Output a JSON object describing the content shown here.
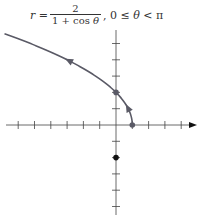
{
  "equation": {
    "lhs": "r =",
    "numerator": "2",
    "denominator_prefix": "1 + cos ",
    "denominator_var": "θ",
    "range_prefix": ", 0 ≤ ",
    "range_var": "θ",
    "range_suffix": " < π"
  },
  "colors": {
    "curve": "#5a5a66",
    "axis": "#444444",
    "point_on_curve": "#5a5a66",
    "focus_point": "#111111"
  },
  "axes": {
    "origin_px": [
      116,
      125
    ],
    "unit_px": 16.3,
    "x_ticks": [
      -6,
      -5,
      -4,
      -3,
      -2,
      -1,
      1,
      2,
      3,
      4
    ],
    "y_ticks": [
      -5,
      -4,
      -3,
      -2,
      -1,
      1,
      2,
      3,
      4,
      5
    ]
  },
  "points": [
    {
      "label": "vertex",
      "x": 1,
      "y": 0
    },
    {
      "label": "y-intercept",
      "x": 0,
      "y": 2
    },
    {
      "label": "focus-related point",
      "x": 0,
      "y": -2
    }
  ]
}
